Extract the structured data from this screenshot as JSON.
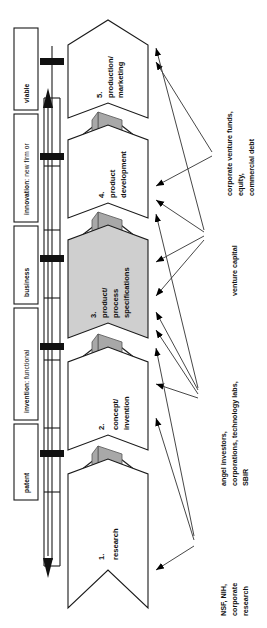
{
  "diagram": {
    "orientation": "rotated-90-ccw",
    "colors": {
      "line": "#1a1a1a",
      "thin_line": "#4a4a4a",
      "shaded_stage_fill": "#cfcfcf",
      "connector_fill": "#a8a8a8",
      "tick_marker": "#111111",
      "background": "#ffffff"
    }
  },
  "milestones": [
    {
      "id": "patent",
      "label": "patent"
    },
    {
      "id": "invention",
      "label_bold": "invention",
      "label_rest": ": functional"
    },
    {
      "id": "business",
      "label": "business"
    },
    {
      "id": "innovation",
      "label_bold": "innovation",
      "label_rest": ": new firm or"
    },
    {
      "id": "viable",
      "label": "viable"
    }
  ],
  "stages": [
    {
      "number": "1.",
      "line1": "research",
      "line2": "",
      "shaded": false
    },
    {
      "number": "2.",
      "line1": "concept/",
      "line2": "invention",
      "shaded": false
    },
    {
      "number": "3.",
      "line1": "product/",
      "line2": "process",
      "line3": "specifications",
      "shaded": true
    },
    {
      "number": "4.",
      "line1": "product",
      "line2": "development",
      "shaded": false
    },
    {
      "number": "5.",
      "line1": "production/",
      "line2": "marketing",
      "shaded": false
    }
  ],
  "funding_sources": [
    {
      "id": "nsf-nih",
      "lines": [
        "NSF, NIH,",
        "corporate",
        "research"
      ]
    },
    {
      "id": "angel-investors",
      "lines": [
        "angel investors,",
        "corporations, technology labs,",
        "SBIR"
      ]
    },
    {
      "id": "venture-capital",
      "lines": [
        "venture capital"
      ]
    },
    {
      "id": "corporate-venture-funds",
      "lines": [
        "corporate venture funds,",
        "equity,",
        "commercial debt"
      ]
    }
  ]
}
